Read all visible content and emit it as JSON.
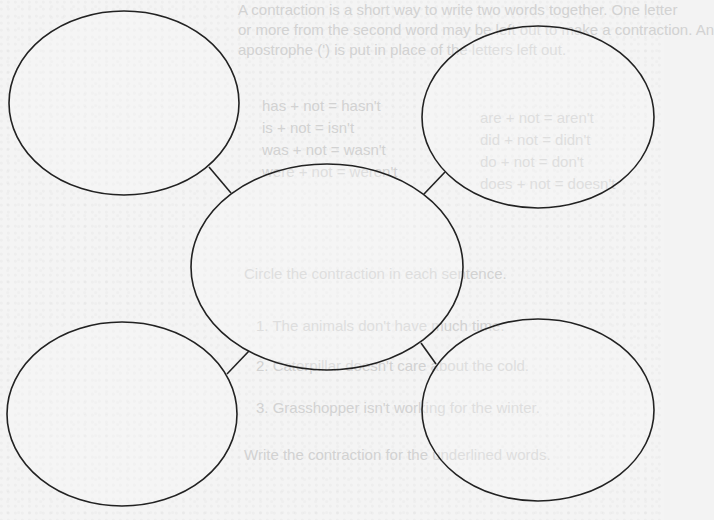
{
  "diagram": {
    "type": "web-organizer",
    "nodes": [
      {
        "id": "center",
        "label": ""
      },
      {
        "id": "top-left",
        "label": ""
      },
      {
        "id": "top-right",
        "label": ""
      },
      {
        "id": "bottom-left",
        "label": ""
      },
      {
        "id": "bottom-right",
        "label": ""
      }
    ],
    "edges": [
      {
        "from": "center",
        "to": "top-left"
      },
      {
        "from": "center",
        "to": "top-right"
      },
      {
        "from": "center",
        "to": "bottom-left"
      },
      {
        "from": "center",
        "to": "bottom-right"
      }
    ],
    "stroke_color": "#222222",
    "fill_color": "#f7f7f7"
  },
  "bleed_through_text": {
    "line1": "A contraction is a short way to write two words together. One letter",
    "line2": "or more from the second word may be left out to make a contraction. An",
    "line3": "apostrophe (') is put in place of the letters left out.",
    "pairs": [
      "are + not = aren't",
      "did + not = didn't",
      "do + not = don't",
      "does + not = doesn't",
      "has + not = hasn't",
      "is + not = isn't",
      "was + not = wasn't",
      "were + not = weren't"
    ],
    "instruction1": "Circle the contraction in each sentence.",
    "sentence1": "1. The animals don't have much time.",
    "sentence2": "2. Caterpillar doesn't care about the cold.",
    "sentence3": "3. Grasshopper isn't working for the winter.",
    "instruction2": "Write the contraction for the underlined words."
  }
}
